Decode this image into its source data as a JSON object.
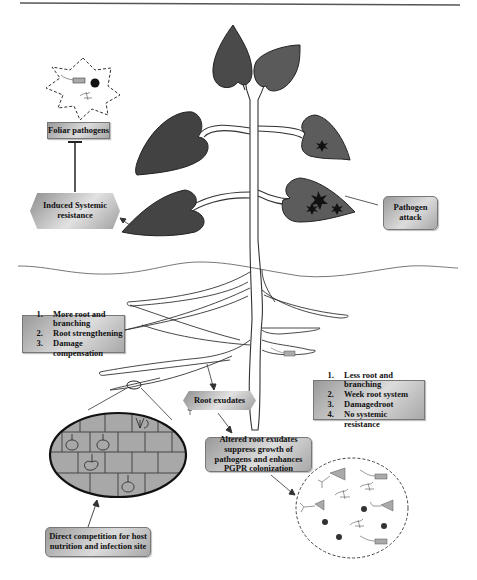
{
  "diagram": {
    "labels": {
      "foliar_pathogens": "Foliar pathogens",
      "induced_systemic_resistance": "Induced Systemic resistance",
      "pathogen_attack": "Pathogen attack",
      "root_exudates": "Root exudates",
      "altered_root_exudates": "Altered root exudates suppress growth of pathogens and enhances PGPR colonization",
      "direct_competition": "Direct competition for host nutrition and infection site"
    },
    "left_list": {
      "items": [
        "More root and branching",
        "Root strengthening",
        "Damage compensation"
      ]
    },
    "right_list": {
      "items": [
        "Less root and branching",
        "Week root system",
        "Damagedroot",
        "No systemic resistance"
      ]
    },
    "colors": {
      "leaf_dark": "#4a4a4a",
      "leaf_medium": "#686868",
      "box_gradient_light": "#dcdcdc",
      "box_gradient_dark": "#9a9a9a",
      "outline": "#333333"
    }
  }
}
